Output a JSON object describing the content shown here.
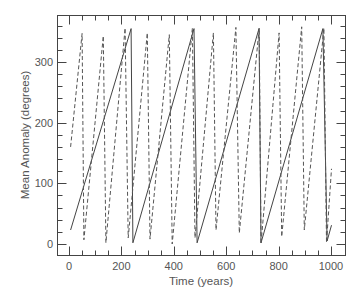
{
  "chart_data": {
    "type": "line",
    "title": "",
    "xlabel": "Time (years)",
    "ylabel": "Mean Anomaly (degrees)",
    "xlim": [
      -30,
      1050
    ],
    "ylim": [
      -20,
      370
    ],
    "xticks": [
      0,
      200,
      400,
      600,
      800,
      1000
    ],
    "yticks": [
      0,
      100,
      200,
      300
    ],
    "x_minor_step": 50,
    "y_minor_step": 20,
    "grid": false,
    "legend": null,
    "series": [
      {
        "name": "solid",
        "style": "solid",
        "color": "#444444",
        "points": [
          [
            6,
            23
          ],
          [
            237,
            355
          ],
          [
            244,
            2
          ],
          [
            477,
            355
          ],
          [
            489,
            2
          ],
          [
            725,
            355
          ],
          [
            733,
            2
          ],
          [
            969,
            355
          ],
          [
            985,
            5
          ],
          [
            1002,
            31
          ]
        ]
      },
      {
        "name": "dashed",
        "style": "dashed",
        "color": "#555555",
        "points": [
          [
            6,
            160
          ],
          [
            50,
            347
          ],
          [
            57,
            7
          ],
          [
            131,
            343
          ],
          [
            141,
            2
          ],
          [
            214,
            356
          ],
          [
            226,
            10
          ],
          [
            299,
            348
          ],
          [
            309,
            8
          ],
          [
            383,
            345
          ],
          [
            394,
            0
          ],
          [
            471,
            356
          ],
          [
            481,
            10
          ],
          [
            551,
            348
          ],
          [
            561,
            23
          ],
          [
            637,
            357
          ],
          [
            650,
            18
          ],
          [
            726,
            356
          ],
          [
            733,
            0
          ],
          [
            802,
            348
          ],
          [
            812,
            12
          ],
          [
            888,
            358
          ],
          [
            898,
            23
          ],
          [
            973,
            356
          ],
          [
            983,
            2
          ],
          [
            1002,
            124
          ]
        ]
      }
    ]
  },
  "axes": {
    "x_title": "Time (years)",
    "y_title": "Mean Anomaly (degrees)",
    "x_tick_labels": [
      "0",
      "200",
      "400",
      "600",
      "800",
      "1000"
    ],
    "y_tick_labels": [
      "0",
      "100",
      "200",
      "300"
    ]
  },
  "colors": {
    "frame": "#444444",
    "text": "#555555"
  }
}
